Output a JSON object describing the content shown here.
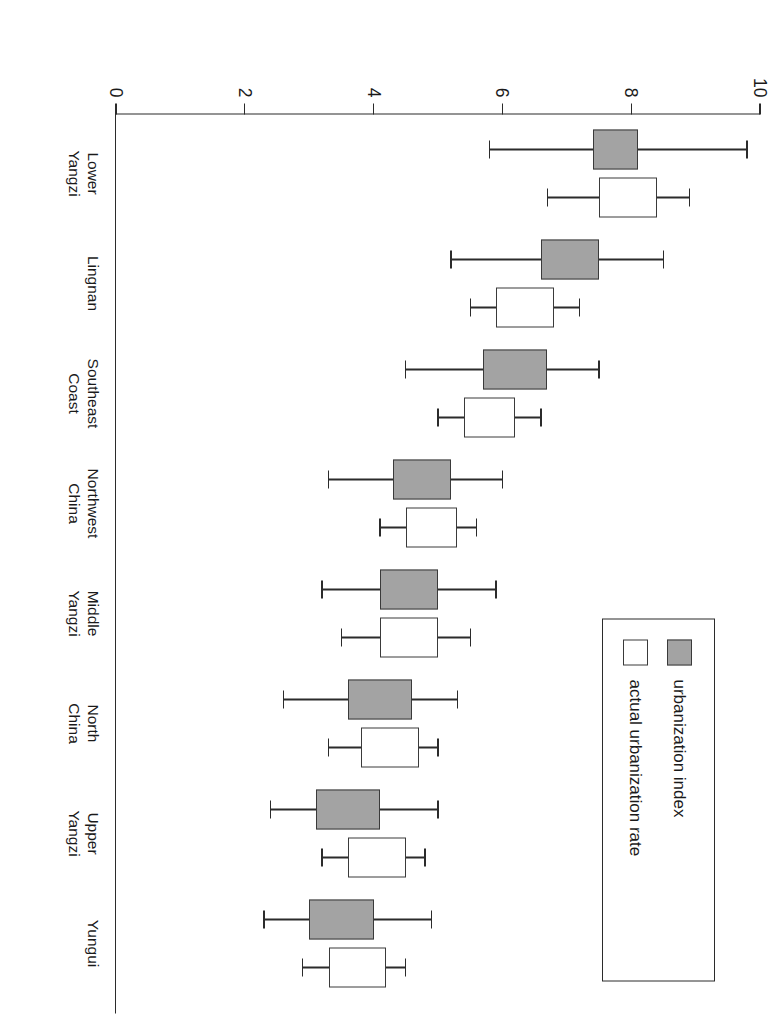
{
  "chart_data": {
    "type": "bar",
    "title": "",
    "subtitle": "",
    "xlabel": "",
    "ylabel": "",
    "orientation": "rotated-90",
    "grid": false,
    "ylim": [
      0,
      10
    ],
    "ytick_labels": [
      "10",
      "8",
      "6",
      "4",
      "2",
      "0"
    ],
    "ytick_values": [
      10,
      8,
      6,
      4,
      2,
      0
    ],
    "categories": [
      "Lower\nYangzi",
      "Lingnan",
      "Southeast\nCoast",
      "Northwest\nChina",
      "Middle\nYangzi",
      "North\nChina",
      "Upper\nYangzi",
      "Yungui"
    ],
    "legend": {
      "position": "top-left",
      "entries": [
        {
          "label": "urbanization index",
          "swatch": "filled",
          "color": "#a3a3a3"
        },
        {
          "label": "actual urbanization rate",
          "swatch": "hollow",
          "color": "#ffffff"
        }
      ]
    },
    "series": [
      {
        "name": "urbanization index",
        "style": "filled",
        "color": "#a3a3a3",
        "boxes": [
          {
            "category": "Lower Yangzi",
            "whisker_low": 5.8,
            "box_low": 7.4,
            "box_high": 8.1,
            "whisker_high": 9.8
          },
          {
            "category": "Lingnan",
            "whisker_low": 5.2,
            "box_low": 6.6,
            "box_high": 7.5,
            "whisker_high": 8.5
          },
          {
            "category": "Southeast Coast",
            "whisker_low": 4.5,
            "box_low": 5.7,
            "box_high": 6.7,
            "whisker_high": 7.5
          },
          {
            "category": "Northwest China",
            "whisker_low": 3.3,
            "box_low": 4.3,
            "box_high": 5.2,
            "whisker_high": 6.0
          },
          {
            "category": "Middle Yangzi",
            "whisker_low": 3.2,
            "box_low": 4.1,
            "box_high": 5.0,
            "whisker_high": 5.9
          },
          {
            "category": "North China",
            "whisker_low": 2.6,
            "box_low": 3.6,
            "box_high": 4.6,
            "whisker_high": 5.3
          },
          {
            "category": "Upper Yangzi",
            "whisker_low": 2.4,
            "box_low": 3.1,
            "box_high": 4.1,
            "whisker_high": 5.0
          },
          {
            "category": "Yungui",
            "whisker_low": 2.3,
            "box_low": 3.0,
            "box_high": 4.0,
            "whisker_high": 4.9
          }
        ]
      },
      {
        "name": "actual urbanization rate",
        "style": "hollow",
        "color": "#ffffff",
        "boxes": [
          {
            "category": "Lower Yangzi",
            "whisker_low": 6.7,
            "box_low": 7.5,
            "box_high": 8.4,
            "whisker_high": 8.9
          },
          {
            "category": "Lingnan",
            "whisker_low": 5.5,
            "box_low": 5.9,
            "box_high": 6.8,
            "whisker_high": 7.2
          },
          {
            "category": "Southeast Coast",
            "whisker_low": 5.0,
            "box_low": 5.4,
            "box_high": 6.2,
            "whisker_high": 6.6
          },
          {
            "category": "Northwest China",
            "whisker_low": 4.1,
            "box_low": 4.5,
            "box_high": 5.3,
            "whisker_high": 5.6
          },
          {
            "category": "Middle Yangzi",
            "whisker_low": 3.5,
            "box_low": 4.1,
            "box_high": 5.0,
            "whisker_high": 5.5
          },
          {
            "category": "North China",
            "whisker_low": 3.3,
            "box_low": 3.8,
            "box_high": 4.7,
            "whisker_high": 5.0
          },
          {
            "category": "Upper Yangzi",
            "whisker_low": 3.2,
            "box_low": 3.6,
            "box_high": 4.5,
            "whisker_high": 4.8
          },
          {
            "category": "Yungui",
            "whisker_low": 2.9,
            "box_low": 3.3,
            "box_high": 4.2,
            "whisker_high": 4.5
          }
        ]
      }
    ]
  }
}
